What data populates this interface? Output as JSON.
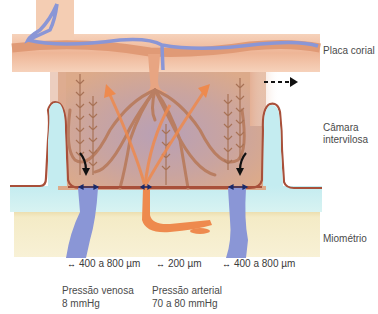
{
  "diagram": {
    "labels": {
      "chorionic_plate": "Placa corial",
      "intervillous_space_line1": "Câmara",
      "intervillous_space_line2": "intervilosa",
      "myometrium": "Miométrio"
    },
    "measurements": [
      {
        "arrow": "↔",
        "text": "400 a 800 µm"
      },
      {
        "arrow": "↔",
        "text": "200 µm"
      },
      {
        "arrow": "↔",
        "text": "400 a 800 µm"
      }
    ],
    "pressures": {
      "venous": {
        "label": "Pressão venosa",
        "value": "8 mmHg"
      },
      "arterial": {
        "label": "Pressão arterial",
        "value": "70 a 80 mmHg"
      }
    },
    "colors": {
      "chorionic_plate": "#f2c3a6",
      "chorionic_vessel": "#e6a27e",
      "vein": "#8a96d6",
      "artery_flow": "#ee8a4e",
      "intervillous": "#c9a192",
      "decidua": "#c9eef0",
      "myometrium": "#f6efcd",
      "septum_outline": "#a8503a",
      "villus": "#c08a6a"
    }
  }
}
